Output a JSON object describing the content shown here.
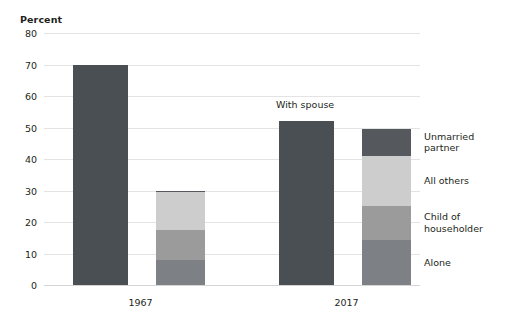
{
  "chart_data": {
    "type": "bar",
    "title": "",
    "subtitle": "",
    "xlabel": "",
    "ylabel": "Percent",
    "ylim": [
      0,
      80
    ],
    "yticks": [
      0,
      10,
      20,
      30,
      40,
      50,
      60,
      70,
      80
    ],
    "ytick_labels": [
      "0",
      "10",
      "20",
      "30",
      "40",
      "50",
      "60",
      "70",
      "80"
    ],
    "grid": true,
    "legend_position": "right",
    "categories": [
      "1967",
      "2017"
    ],
    "annotations": [
      {
        "text": "With spouse",
        "x": "2017",
        "series": "With spouse"
      }
    ],
    "series": [
      {
        "name": "With spouse",
        "stacked": false,
        "color": "#4a4f53",
        "values": [
          70.0,
          52.0
        ]
      },
      {
        "name": "Unmarried partner",
        "stacked": true,
        "color": "#55595d",
        "values": [
          0.6,
          8.5
        ]
      },
      {
        "name": "All others",
        "stacked": true,
        "color": "#cdcdcd",
        "values": [
          11.8,
          16.0
        ]
      },
      {
        "name": "Child of householder",
        "stacked": true,
        "color": "#9b9b9b",
        "values": [
          9.6,
          10.6
        ]
      },
      {
        "name": "Alone",
        "stacked": true,
        "color": "#7d8084",
        "values": [
          8.0,
          14.4
        ]
      }
    ],
    "stacked_totals": [
      30.0,
      49.5
    ]
  },
  "axis": {
    "title": "Percent",
    "ticks": [
      {
        "label": "80",
        "value": 80
      },
      {
        "label": "70",
        "value": 70
      },
      {
        "label": "60",
        "value": 60
      },
      {
        "label": "50",
        "value": 50
      },
      {
        "label": "40",
        "value": 40
      },
      {
        "label": "30",
        "value": 30
      },
      {
        "label": "20",
        "value": 20
      },
      {
        "label": "10",
        "value": 10
      },
      {
        "label": "0",
        "value": 0
      }
    ]
  },
  "groups": [
    {
      "label": "1967"
    },
    {
      "label": "2017"
    }
  ],
  "annotations": {
    "with_spouse": "With spouse"
  },
  "legend": {
    "items": [
      {
        "label": "Unmarried\npartner",
        "color": "#55595d"
      },
      {
        "label": "All others",
        "color": "#cdcdcd"
      },
      {
        "label": "Child of\nhouseholder",
        "color": "#9b9b9b"
      },
      {
        "label": "Alone",
        "color": "#7d8084"
      }
    ]
  },
  "colors": {
    "with_spouse": "#4a4f53",
    "unmarried_partner": "#55595d",
    "all_others": "#cdcdcd",
    "child_of_householder": "#9b9b9b",
    "alone": "#7d8084",
    "gridline": "#e3e3e4",
    "text": "#231f20",
    "background": "#ffffff"
  }
}
